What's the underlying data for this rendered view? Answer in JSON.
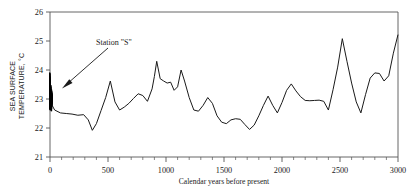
{
  "chart_data": {
    "type": "line",
    "title": "",
    "xlabel": "Calendar years before present",
    "ylabel": "SEA SURFACE TEMPERATURE, °C",
    "ylabel_line1": "SEA SURFACE",
    "ylabel_line2": "TEMPERATURE, °C",
    "xlim": [
      0,
      3000
    ],
    "ylim": [
      21,
      26
    ],
    "grid": false,
    "legend": "none",
    "x_major_ticks": [
      0,
      500,
      1000,
      1500,
      2000,
      2500,
      3000
    ],
    "x_major_tick_labels": [
      "0",
      "500",
      "1000",
      "1500",
      "2000",
      "2500",
      "3000"
    ],
    "x_minor_tick_interval": 100,
    "y_major_ticks": [
      21,
      22,
      23,
      24,
      25,
      26
    ],
    "y_major_tick_labels": [
      "21",
      "22",
      "23",
      "24",
      "25",
      "26"
    ],
    "series": [
      {
        "name": "Sargasso Sea sea surface temperature",
        "line_color": "#1a1a1a",
        "x": [
          0,
          40,
          90,
          140,
          190,
          240,
          290,
          330,
          365,
          400,
          440,
          480,
          520,
          560,
          600,
          640,
          680,
          720,
          760,
          800,
          840,
          880,
          900,
          920,
          950,
          980,
          1010,
          1040,
          1070,
          1100,
          1130,
          1160,
          1200,
          1240,
          1280,
          1320,
          1360,
          1400,
          1440,
          1480,
          1520,
          1560,
          1600,
          1640,
          1680,
          1720,
          1760,
          1800,
          1840,
          1880,
          1920,
          1960,
          2000,
          2040,
          2080,
          2120,
          2160,
          2200,
          2240,
          2280,
          2320,
          2360,
          2400,
          2440,
          2480,
          2520,
          2560,
          2600,
          2640,
          2680,
          2720,
          2760,
          2800,
          2840,
          2880,
          2920,
          2960,
          3000
        ],
        "y": [
          22.92,
          22.62,
          22.52,
          22.5,
          22.48,
          22.44,
          22.46,
          22.28,
          21.92,
          22.15,
          22.6,
          23.05,
          23.62,
          22.9,
          22.62,
          22.72,
          22.85,
          23.02,
          23.18,
          23.12,
          22.92,
          23.35,
          23.78,
          24.3,
          23.7,
          23.62,
          23.55,
          23.58,
          23.3,
          23.42,
          24.0,
          23.62,
          23.05,
          22.62,
          22.58,
          22.78,
          23.05,
          22.85,
          22.42,
          22.2,
          22.15,
          22.28,
          22.32,
          22.3,
          22.12,
          21.95,
          22.1,
          22.42,
          22.78,
          23.1,
          22.78,
          22.52,
          22.88,
          23.3,
          23.52,
          23.28,
          23.08,
          22.95,
          22.94,
          22.95,
          22.96,
          22.92,
          22.62,
          23.32,
          24.1,
          25.08,
          24.3,
          23.55,
          22.9,
          22.52,
          23.15,
          23.72,
          23.9,
          23.88,
          23.62,
          23.8,
          24.58,
          25.22
        ]
      },
      {
        "name": "Station S instrumental record",
        "line_color": "#000000",
        "note": "dense high-frequency bundle at x ≈ 0",
        "x_center": 0,
        "y_min": 22.58,
        "y_max": 23.95
      }
    ],
    "annotations": [
      {
        "text": "Station \"S\"",
        "target_x": 0,
        "target_y": 23.0,
        "type": "arrow-label"
      }
    ]
  }
}
